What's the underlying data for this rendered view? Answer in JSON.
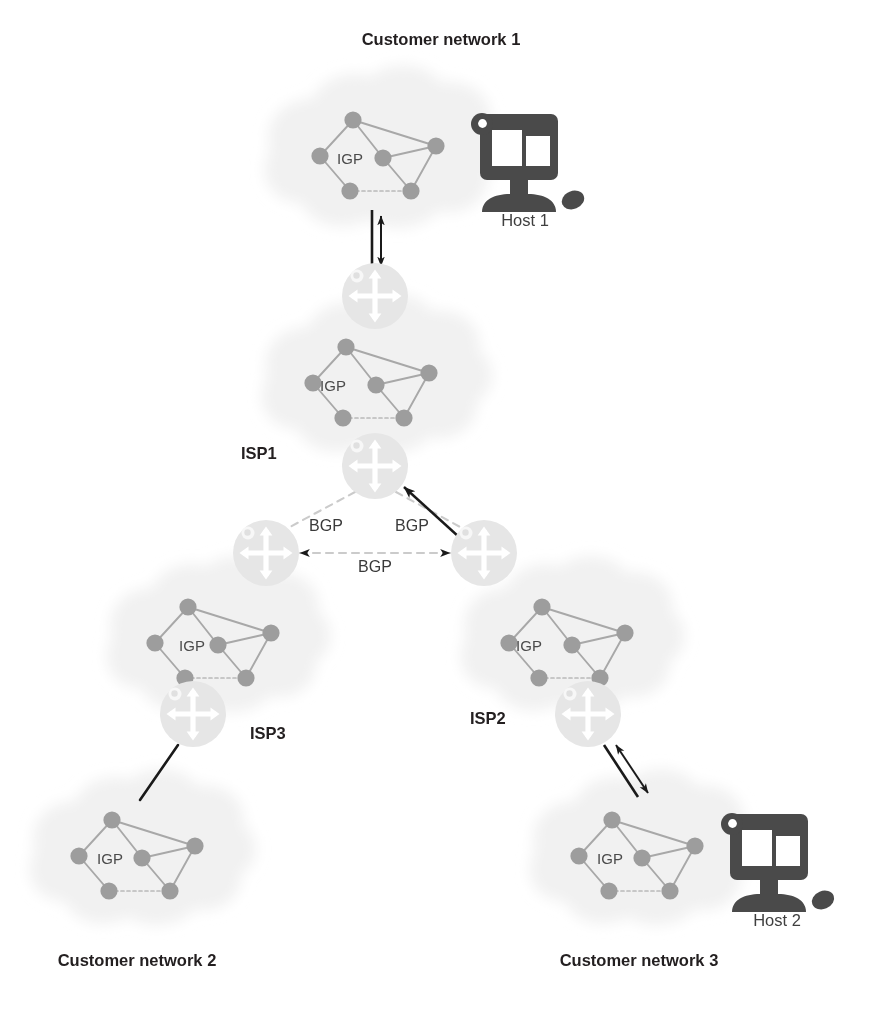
{
  "figure": {
    "kind": "network-topology-diagram",
    "background_color": "#ffffff"
  },
  "palette": {
    "router_fill": "#e6e6e6",
    "router_arrow": "#ffffff",
    "igp_node": "#9d9d9d",
    "igp_link": "#a8a8a8",
    "cloud_fill": "#f2f2f2",
    "bgp_dashed": "#c9c9c9",
    "black_link": "#1a1a1a",
    "host_fill": "#4a4a4a",
    "host_screen": "#ffffff",
    "text": "#231f20"
  },
  "labels": {
    "customer_network_1": "Customer network 1",
    "customer_network_2": "Customer network 2",
    "customer_network_3": "Customer network 3",
    "isp1": "ISP1",
    "isp2": "ISP2",
    "isp3": "ISP3",
    "host1": "Host 1",
    "host2": "Host 2",
    "igp_cn1": "IGP",
    "igp_isp1": "IGP",
    "igp_isp3": "IGP",
    "igp_isp2": "IGP",
    "igp_cn2": "IGP",
    "igp_cn3": "IGP",
    "bgp_left": "BGP",
    "bgp_right": "BGP",
    "bgp_bottom": "BGP"
  },
  "clouds": [
    {
      "id": "cn1",
      "name": "customer-network-1-cloud",
      "cx": 378,
      "cy": 158,
      "label": "IGP"
    },
    {
      "id": "isp1",
      "name": "isp1-cloud",
      "cx": 371,
      "cy": 385,
      "label": "IGP"
    },
    {
      "id": "isp3",
      "name": "isp3-cloud",
      "cx": 213,
      "cy": 645,
      "label": "IGP"
    },
    {
      "id": "isp2",
      "name": "isp2-cloud",
      "cx": 567,
      "cy": 645,
      "label": "IGP"
    },
    {
      "id": "cn2",
      "name": "customer-network-2-cloud",
      "cx": 137,
      "cy": 858,
      "label": "IGP"
    },
    {
      "id": "cn3",
      "name": "customer-network-3-cloud",
      "cx": 637,
      "cy": 858,
      "label": "IGP"
    }
  ],
  "routers": [
    {
      "id": "r_isp1_top",
      "name": "isp1-top-router",
      "cx": 375,
      "cy": 296,
      "r": 33
    },
    {
      "id": "r_isp1_bottom",
      "name": "isp1-border-router",
      "cx": 375,
      "cy": 466,
      "r": 33
    },
    {
      "id": "r_isp3_border",
      "name": "isp3-border-router",
      "cx": 266,
      "cy": 553,
      "r": 33
    },
    {
      "id": "r_isp2_border",
      "name": "isp2-border-router",
      "cx": 484,
      "cy": 553,
      "r": 33
    },
    {
      "id": "r_isp3_edge",
      "name": "isp3-edge-router",
      "cx": 193,
      "cy": 714,
      "r": 33
    },
    {
      "id": "r_isp2_edge",
      "name": "isp2-edge-router",
      "cx": 588,
      "cy": 714,
      "r": 33
    }
  ],
  "hosts": [
    {
      "id": "host1",
      "name": "host-1-computer",
      "x": 472,
      "y": 108,
      "label": "Host 1"
    },
    {
      "id": "host2",
      "name": "host-2-computer",
      "x": 722,
      "y": 808,
      "label": "Host 2"
    }
  ],
  "bgp_links": [
    {
      "id": "bgp_isp1_isp3",
      "name": "bgp-link-isp1-isp3",
      "from": "r_isp1_bottom",
      "to": "r_isp3_border",
      "style": "dashed",
      "label": "BGP"
    },
    {
      "id": "bgp_isp1_isp2",
      "name": "bgp-link-isp1-isp2",
      "from": "r_isp1_bottom",
      "to": "r_isp2_border",
      "style": "dashed",
      "label": "BGP",
      "overlay_arrow": "double"
    },
    {
      "id": "bgp_isp3_isp2",
      "name": "bgp-link-isp3-isp2",
      "from": "r_isp3_border",
      "to": "r_isp2_border",
      "style": "dashed",
      "label": "BGP"
    }
  ],
  "access_links": [
    {
      "id": "link_cn1_isp1",
      "name": "access-link-customer1-isp1",
      "style": "solid-black",
      "arrow": "double"
    },
    {
      "id": "link_isp3_cn2",
      "name": "access-link-isp3-customer2",
      "style": "solid-black",
      "arrow": "none"
    },
    {
      "id": "link_isp2_cn3",
      "name": "access-link-isp2-customer3",
      "style": "solid-black",
      "arrow": "double"
    }
  ],
  "title_positions": {
    "customer_network_1": {
      "x": 441,
      "y": 45,
      "anchor": "middle"
    },
    "customer_network_2": {
      "x": 137,
      "y": 966,
      "anchor": "middle"
    },
    "customer_network_3": {
      "x": 639,
      "y": 966,
      "anchor": "middle"
    },
    "isp1": {
      "x": 241,
      "y": 459,
      "anchor": "start"
    },
    "isp2": {
      "x": 470,
      "y": 724,
      "anchor": "start"
    },
    "isp3": {
      "x": 250,
      "y": 739,
      "anchor": "start"
    },
    "bgp_left": {
      "x": 326,
      "y": 531,
      "anchor": "middle"
    },
    "bgp_right": {
      "x": 412,
      "y": 531,
      "anchor": "middle"
    },
    "bgp_bottom": {
      "x": 375,
      "y": 572,
      "anchor": "middle"
    },
    "host1": {
      "x": 525,
      "y": 226,
      "anchor": "middle"
    },
    "host2": {
      "x": 777,
      "y": 926,
      "anchor": "middle"
    }
  }
}
